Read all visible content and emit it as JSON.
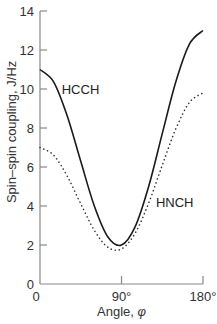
{
  "chart_data": {
    "type": "line",
    "title": "",
    "xlabel": "Angle, φ",
    "ylabel": "Spin–spin coupling, J/Hz",
    "xlim": [
      0,
      180
    ],
    "ylim": [
      0,
      14
    ],
    "grid": false,
    "legend": "none (inline curve labels)",
    "x_ticks": [
      {
        "value": 0,
        "label": "0"
      },
      {
        "value": 90,
        "label": "90°"
      },
      {
        "value": 180,
        "label": "180°"
      }
    ],
    "y_ticks": [
      {
        "value": 0,
        "label": "0"
      },
      {
        "value": 2,
        "label": "2"
      },
      {
        "value": 4,
        "label": "4"
      },
      {
        "value": 6,
        "label": "6"
      },
      {
        "value": 8,
        "label": "8"
      },
      {
        "value": 10,
        "label": "10"
      },
      {
        "value": 12,
        "label": "12"
      },
      {
        "value": 14,
        "label": "14"
      }
    ],
    "x": [
      0,
      15,
      30,
      45,
      60,
      75,
      90,
      105,
      120,
      135,
      150,
      165,
      180
    ],
    "series": [
      {
        "name": "HCCH",
        "style": "solid",
        "color": "#1a1a1a",
        "label_at": {
          "x": 24,
          "y": 10.0
        },
        "values": [
          11.0,
          10.37,
          8.63,
          6.29,
          4.0,
          2.41,
          2.0,
          2.93,
          5.0,
          7.71,
          10.37,
          12.3,
          13.0
        ]
      },
      {
        "name": "HNCH",
        "style": "dotted",
        "color": "#333333",
        "label_at": {
          "x": 128,
          "y": 4.2
        },
        "values": [
          7.0,
          6.61,
          5.54,
          4.11,
          2.75,
          1.88,
          1.8,
          2.6,
          4.15,
          6.09,
          7.96,
          9.31,
          9.8
        ]
      }
    ]
  }
}
